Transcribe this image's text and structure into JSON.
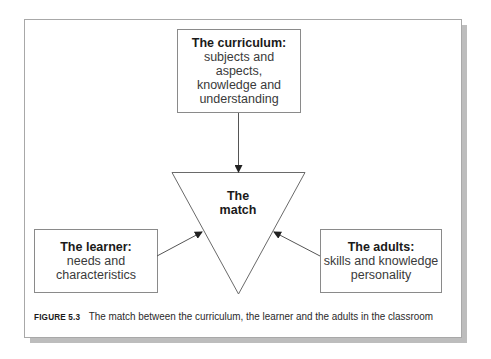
{
  "figure": {
    "nodes": {
      "curriculum": {
        "title": "The curriculum:",
        "lines": [
          "subjects and",
          "aspects,",
          "knowledge and",
          "understanding"
        ]
      },
      "match": {
        "lines": [
          "The",
          "match"
        ]
      },
      "learner": {
        "title": "The learner:",
        "lines": [
          "needs and",
          "characteristics"
        ]
      },
      "adults": {
        "title": "The adults:",
        "lines": [
          "skills and knowledge",
          "personality"
        ]
      }
    },
    "edges": [
      {
        "from": "curriculum",
        "to": "match"
      },
      {
        "from": "learner",
        "to": "match"
      },
      {
        "from": "adults",
        "to": "match"
      }
    ],
    "caption": {
      "label": "FIGURE 5.3",
      "text": "The match between the curriculum, the learner and the adults in the classroom"
    },
    "colors": {
      "line": "#6a6a6a",
      "border": "#8a8a8a",
      "shadow": "#bdbdbd"
    }
  }
}
